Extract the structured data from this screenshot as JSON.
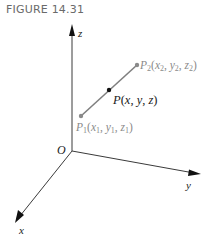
{
  "figure": {
    "caption": "FIGURE 14.31"
  },
  "axes": {
    "x_label": "x",
    "y_label": "y",
    "z_label": "z",
    "origin_label": "O"
  },
  "points": {
    "p1": {
      "name": "P",
      "sub": "1",
      "coords": [
        "x",
        "1",
        "y",
        "1",
        "z",
        "1"
      ],
      "label": "P1(x1, y1, z1)"
    },
    "p2": {
      "name": "P",
      "sub": "2",
      "coords": [
        "x",
        "2",
        "y",
        "2",
        "z",
        "2"
      ],
      "label": "P2(x2, y2, z2)"
    },
    "p": {
      "label": "P(x, y, z)"
    }
  },
  "colors": {
    "segment": "#7f7f7f",
    "axis": "#3a3a3a",
    "point_midpoint": "#111111",
    "endpoint": "#8a8a8a"
  }
}
